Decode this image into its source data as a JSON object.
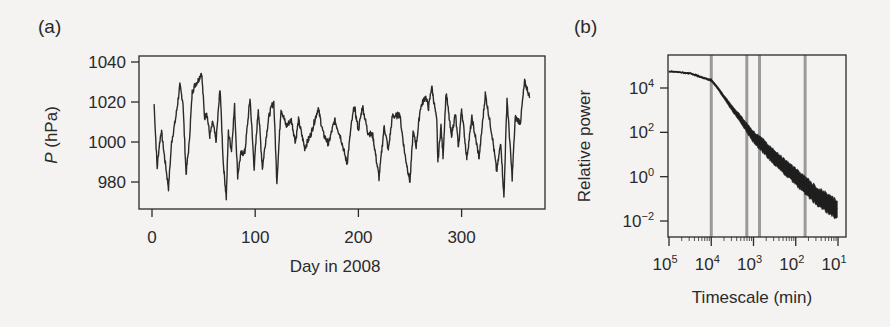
{
  "figure": {
    "panels": [
      {
        "label": "(a)"
      },
      {
        "label": "(b)"
      }
    ]
  },
  "chart_data": [
    {
      "type": "line",
      "panel": "(a)",
      "title": "",
      "xlabel": "Day in 2008",
      "ylabel_var": "P",
      "ylabel_unit": " (hPa)",
      "xlim": [
        -2,
        380
      ],
      "ylim": [
        967,
        1043
      ],
      "xticks": [
        0,
        100,
        200,
        300
      ],
      "xtick_labels": [
        "0",
        "100",
        "200",
        "300"
      ],
      "yticks": [
        980,
        1000,
        1020,
        1040
      ],
      "ytick_labels": [
        "980",
        "1000",
        "1020",
        "1040"
      ],
      "grid": false,
      "series": [
        {
          "name": "Surface pressure",
          "color": "#2a2a2a",
          "x": [
            2,
            5,
            7,
            9,
            12,
            16,
            19,
            23,
            27,
            30,
            33,
            36,
            39,
            42,
            45,
            48,
            51,
            53,
            56,
            59,
            62,
            66,
            69,
            72,
            74,
            77,
            80,
            83,
            86,
            90,
            95,
            99,
            103,
            107,
            110,
            113,
            116,
            118,
            121,
            125,
            130,
            135,
            139,
            142,
            148,
            154,
            161,
            166,
            171,
            177,
            183,
            189,
            193,
            196,
            200,
            204,
            209,
            214,
            220,
            225,
            229,
            233,
            237,
            240,
            245,
            250,
            253,
            256,
            260,
            265,
            268,
            271,
            276,
            277,
            280,
            282,
            285,
            290,
            294,
            297,
            300,
            305,
            310,
            317,
            323,
            330,
            334,
            338,
            341,
            344,
            349,
            352,
            357,
            361,
            364,
            366
          ],
          "y": [
            1019,
            987,
            998,
            1006,
            993,
            977,
            1000,
            1012,
            1028,
            1020,
            984,
            999,
            1025,
            1029,
            1031,
            1035,
            1012,
            1015,
            1003,
            1010,
            1000,
            1027,
            990,
            972,
            1005,
            996,
            1018,
            983,
            994,
            995,
            1022,
            987,
            1017,
            987,
            1000,
            1012,
            1018,
            1020,
            980,
            1017,
            1008,
            1011,
            1000,
            1011,
            997,
            1004,
            1017,
            1004,
            999,
            1011,
            1002,
            989,
            1008,
            1018,
            1006,
            1018,
            1005,
            1003,
            982,
            1008,
            996,
            1013,
            1013,
            1014,
            994,
            980,
            1005,
            998,
            1017,
            1023,
            1017,
            1028,
            1010,
            990,
            1008,
            993,
            1025,
            1003,
            1014,
            997,
            1017,
            992,
            1012,
            992,
            1024,
            1002,
            985,
            1000,
            972,
            1022,
            982,
            1012,
            1010,
            1030,
            1026,
            1022
          ]
        }
      ]
    },
    {
      "type": "line",
      "panel": "(b)",
      "title": "",
      "xlabel": "Timescale (min)",
      "ylabel": "Relative power",
      "xscale": "log (reversed)",
      "yscale": "log",
      "xlim": [
        100000,
        10
      ],
      "ylim": [
        0.005,
        300000
      ],
      "xticks": [
        100000,
        10000,
        1000,
        100,
        10
      ],
      "xtick_labels": [
        {
          "base": "10",
          "exp": "5"
        },
        {
          "base": "10",
          "exp": "4"
        },
        {
          "base": "10",
          "exp": "3"
        },
        {
          "base": "10",
          "exp": "2"
        },
        {
          "base": "10",
          "exp": "1"
        }
      ],
      "yticks": [
        0.01,
        1,
        100,
        10000
      ],
      "ytick_labels": [
        {
          "base": "10",
          "exp": "−2"
        },
        {
          "base": "10",
          "exp": "0"
        },
        {
          "base": "10",
          "exp": "2"
        },
        {
          "base": "10",
          "exp": "4"
        }
      ],
      "grid": false,
      "vertical_lines_min": [
        10000,
        1440,
        720,
        60
      ],
      "vertical_line_color": "#9a9a9a",
      "series": [
        {
          "name": "Power spectrum",
          "color": "#1e1e1e",
          "timescale_min": [
            100000,
            50000,
            30000,
            15000,
            10000,
            7000,
            5000,
            3000,
            2000,
            1440,
            1000,
            600,
            300,
            150,
            100,
            60,
            30,
            15,
            10
          ],
          "log10_power": [
            4.75,
            4.7,
            4.65,
            4.45,
            4.35,
            4.0,
            3.6,
            3.0,
            2.6,
            2.2,
            1.8,
            1.4,
            0.8,
            0.3,
            0.0,
            -0.4,
            -0.9,
            -1.3,
            -1.5
          ],
          "band_halfwidth_log10": [
            0.02,
            0.02,
            0.03,
            0.04,
            0.05,
            0.08,
            0.1,
            0.15,
            0.2,
            0.25,
            0.3,
            0.35,
            0.38,
            0.4,
            0.42,
            0.45,
            0.48,
            0.5,
            0.5
          ]
        }
      ]
    }
  ]
}
